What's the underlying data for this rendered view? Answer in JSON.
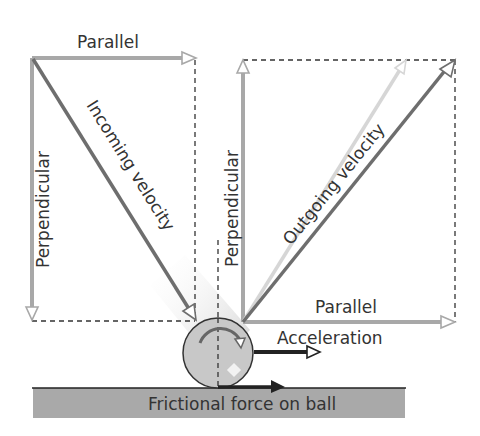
{
  "diagram": {
    "labels": {
      "left_parallel": "Parallel",
      "left_perpendicular": "Perpendicular",
      "incoming_velocity": "Incoming velocity",
      "right_perpendicular": "Perpendicular",
      "outgoing_velocity": "Outgoing velocity",
      "right_parallel": "Parallel",
      "acceleration": "Acceleration",
      "frictional_force": "Frictional force on ball"
    },
    "colors": {
      "component_arrow": "#a8a8a8",
      "velocity_arrow": "#6e6e6e",
      "faint_arrow": "#d6d6d6",
      "dashed_line": "#333333",
      "ball_fill": "#c8c8c8",
      "ground_fill": "#a9a9a9",
      "dark_arrow": "#222222"
    }
  }
}
